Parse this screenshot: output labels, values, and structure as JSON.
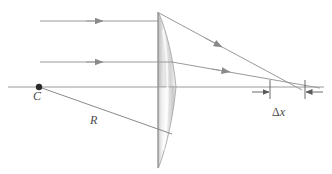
{
  "figure": {
    "type": "optics-ray-diagram",
    "width": 332,
    "height": 174,
    "background_color": "#ffffff",
    "line_color": "#7a7a7a",
    "label_color": "#4a4a4a",
    "lens_fill_light": "#fdfdfd",
    "lens_fill_shade": "#bdbdbd"
  },
  "labels": {
    "center_of_curvature": "C",
    "radius": "R",
    "aberration_delta": "x",
    "aberration_delta_glyph": "Δ"
  },
  "geometry": {
    "optical_axis": {
      "y": 87,
      "x_start": 8,
      "x_end": 324
    },
    "lens": {
      "flat_face_x": 158,
      "apex_x": 176,
      "top_y": 12,
      "bottom_y": 168,
      "axis_y": 87
    },
    "center_point": {
      "x": 39,
      "y": 87,
      "label": "C"
    },
    "incoming_rays": [
      {
        "y": 21,
        "x_start": 40,
        "x_end": 158,
        "arrow_x": 102
      },
      {
        "y": 62,
        "x_start": 40,
        "x_end": 172,
        "arrow_x": 102
      }
    ],
    "refracted_rays": [
      {
        "x1": 160,
        "y1": 13,
        "x2": 300,
        "y2": 89,
        "arrow_t": 0.45
      },
      {
        "x1": 172,
        "y1": 62,
        "x2": 318,
        "y2": 88,
        "arrow_t": 0.42
      }
    ],
    "radius_line": {
      "x1": 39,
      "y1": 87,
      "x2": 171,
      "y2": 134
    },
    "focus_marks": [
      {
        "x": 270,
        "y_top": 80,
        "y_bottom": 99
      },
      {
        "x": 305,
        "y_top": 80,
        "y_bottom": 99
      }
    ],
    "dimension_arrows": [
      {
        "from_x": 253,
        "to_x": 269,
        "y": 92,
        "direction": "right"
      },
      {
        "from_x": 322,
        "to_x": 306,
        "y": 92,
        "direction": "left"
      }
    ]
  }
}
